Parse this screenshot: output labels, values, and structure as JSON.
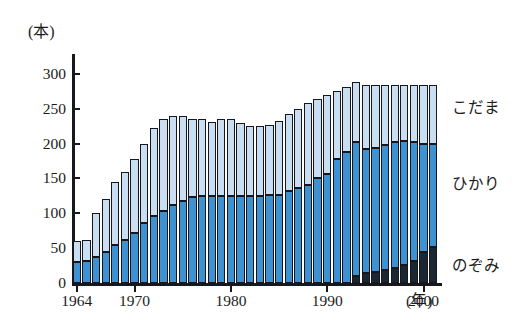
{
  "chart_data": {
    "type": "bar",
    "stacked": true,
    "title": "",
    "subtitle": "",
    "xlabel": "(年)",
    "ylabel": "(本)",
    "ylim": [
      0,
      320
    ],
    "yticks": [
      0,
      50,
      100,
      150,
      200,
      250,
      300
    ],
    "ytick_labels": [
      "0",
      "50",
      "100",
      "150",
      "200",
      "250",
      "300"
    ],
    "xtick_years": [
      1964,
      1970,
      1980,
      1990,
      2000
    ],
    "xtick_labels": [
      "1964",
      "1970",
      "1980",
      "1990",
      "2000"
    ],
    "grid": false,
    "legend_position": "right",
    "categories": [
      1964,
      1965,
      1966,
      1967,
      1968,
      1969,
      1970,
      1971,
      1972,
      1973,
      1974,
      1975,
      1976,
      1977,
      1978,
      1979,
      1980,
      1981,
      1982,
      1983,
      1984,
      1985,
      1986,
      1987,
      1988,
      1989,
      1990,
      1991,
      1992,
      1993,
      1994,
      1995,
      1996,
      1997,
      1998,
      1999,
      2000,
      2001
    ],
    "series": [
      {
        "name": "のぞみ",
        "color": "#1b2733",
        "values": [
          0,
          0,
          0,
          0,
          0,
          0,
          0,
          0,
          0,
          0,
          0,
          0,
          0,
          0,
          0,
          0,
          0,
          0,
          0,
          0,
          0,
          0,
          0,
          0,
          0,
          0,
          0,
          0,
          0,
          10,
          14,
          16,
          18,
          22,
          26,
          32,
          44,
          52
        ]
      },
      {
        "name": "ひかり",
        "color": "#3f92d2",
        "values": [
          30,
          32,
          38,
          45,
          55,
          62,
          72,
          86,
          96,
          104,
          112,
          118,
          124,
          125,
          125,
          125,
          125,
          125,
          125,
          125,
          126,
          126,
          132,
          136,
          140,
          150,
          156,
          178,
          188,
          192,
          178,
          178,
          180,
          180,
          178,
          170,
          156,
          148
        ]
      },
      {
        "name": "こだま",
        "color": "#c9dff1",
        "values": [
          30,
          30,
          62,
          75,
          90,
          98,
          106,
          114,
          126,
          131,
          128,
          122,
          112,
          110,
          106,
          110,
          110,
          105,
          100,
          100,
          101,
          106,
          110,
          114,
          118,
          114,
          114,
          98,
          94,
          86,
          92,
          90,
          86,
          82,
          80,
          82,
          84,
          84
        ]
      }
    ],
    "totals": [
      60,
      62,
      100,
      120,
      145,
      160,
      178,
      200,
      222,
      235,
      240,
      240,
      236,
      235,
      231,
      235,
      235,
      230,
      225,
      225,
      227,
      232,
      242,
      250,
      258,
      264,
      270,
      276,
      282,
      288,
      284,
      284,
      284,
      284,
      284,
      284,
      284,
      284
    ],
    "legend": [
      {
        "label": "こだま",
        "color": "#c9dff1"
      },
      {
        "label": "ひかり",
        "color": "#3f92d2"
      },
      {
        "label": "のぞみ",
        "color": "#1b2733"
      }
    ],
    "annotations": []
  },
  "axis": {
    "y_unit_label": "(本)",
    "x_unit_label": "(年)"
  }
}
